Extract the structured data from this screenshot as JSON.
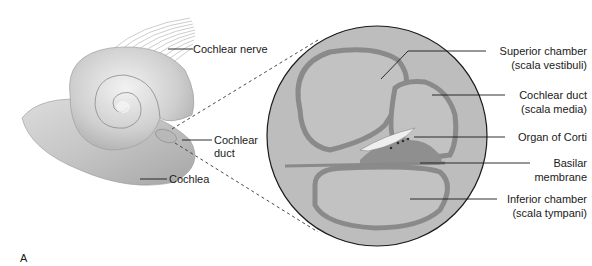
{
  "figure_label": "A",
  "left_view": {
    "labels": {
      "cochlear_nerve": "Cochlear nerve",
      "cochlear_duct_line1": "Cochlear",
      "cochlear_duct_line2": "duct",
      "cochlea": "Cochlea"
    }
  },
  "cross_section": {
    "labels": {
      "superior_line1": "Superior chamber",
      "superior_line2": "(scala vestibuli)",
      "duct_line1": "Cochlear duct",
      "duct_line2": "(scala media)",
      "organ_of_corti": "Organ of Corti",
      "basilar_line1": "Basilar",
      "basilar_line2": "membrane",
      "inferior_line1": "Inferior chamber",
      "inferior_line2": "(scala tympani)"
    }
  },
  "colors": {
    "circle_fill": "#bdbdbd",
    "chamber_wall": "#8a8a8a",
    "cochlea_shell": "#c8c8c8",
    "text": "#1a1a1a"
  }
}
